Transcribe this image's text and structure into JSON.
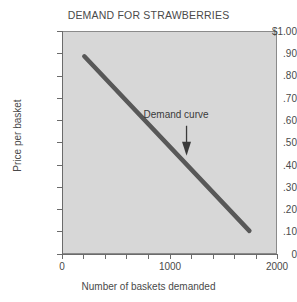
{
  "chart_data": {
    "type": "line",
    "title": "DEMAND FOR STRAWBERRIES",
    "xlabel": "Number of baskets demanded",
    "ylabel": "Price per basket",
    "xlim": [
      0,
      2000
    ],
    "ylim": [
      0,
      1.0
    ],
    "grid": false,
    "legend": "none",
    "x_tick_labels": [
      "0",
      "1000",
      "2000"
    ],
    "x_tick_values": [
      0,
      1000,
      2000
    ],
    "x_minor_tick_values": [
      200,
      400,
      600,
      800,
      1200,
      1400,
      1600,
      1800
    ],
    "y_tick_labels": [
      "$1.00",
      ".90",
      ".80",
      ".70",
      ".60",
      ".50",
      ".40",
      ".30",
      ".20",
      ".10",
      "0"
    ],
    "y_tick_values": [
      1.0,
      0.9,
      0.8,
      0.7,
      0.6,
      0.5,
      0.4,
      0.3,
      0.2,
      0.1,
      0
    ],
    "series": [
      {
        "name": "Demand curve",
        "x": [
          200,
          1750
        ],
        "values": [
          0.89,
          0.1
        ],
        "color": "#585858"
      }
    ],
    "annotations": [
      {
        "text": "Demand curve",
        "x": 1160,
        "y": 0.44,
        "arrow": "down"
      }
    ]
  },
  "colors": {
    "plot_background": "#d7d7d7",
    "curve": "#585858",
    "axis": "#6b6b6b",
    "text": "#4a4a4a"
  }
}
